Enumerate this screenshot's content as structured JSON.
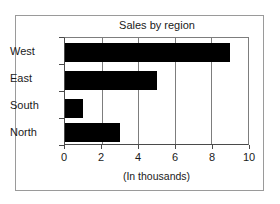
{
  "chart_data": {
    "type": "bar",
    "orientation": "horizontal",
    "title": "Sales by region",
    "xlabel": "(In thousands)",
    "ylabel": "",
    "categories": [
      "North",
      "South",
      "East",
      "West"
    ],
    "values": [
      3,
      1,
      5,
      9
    ],
    "xlim": [
      0,
      10
    ],
    "xticks": [
      0,
      2,
      4,
      6,
      8,
      10
    ],
    "xtick_labels": [
      "0",
      "2",
      "4",
      "6",
      "8",
      "10"
    ],
    "grid": "vertical",
    "legend": null,
    "bar_color": "#000000",
    "frame_color": "#9a9a9a",
    "axis_color": "#4a4a4a",
    "series": [
      {
        "name": "Sales",
        "points": [
          {
            "category": "West",
            "value": 9
          },
          {
            "category": "East",
            "value": 5
          },
          {
            "category": "South",
            "value": 1
          },
          {
            "category": "North",
            "value": 3
          }
        ]
      }
    ]
  }
}
